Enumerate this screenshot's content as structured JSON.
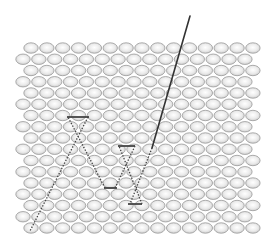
{
  "diagram": {
    "title": "Atomic lattice with probe path",
    "lattice": {
      "rows": 17,
      "cols_per_row": 15,
      "row_start_y": 48,
      "row_spacing": 11.25,
      "col_pitch": 15.85,
      "odd_row_start_x": 31,
      "even_row_start_x": 23,
      "atom_rx": 7.2,
      "atom_ry": 5.2,
      "atom_fill": "#e8e8e8",
      "atom_stroke": "#9a9a9a"
    },
    "probe_line": {
      "points": [
        [
          190,
          16
        ],
        [
          152,
          148
        ]
      ],
      "color": "#333333",
      "width": 1.6
    },
    "dotted_path": {
      "color": "#444444",
      "segments": [
        {
          "type": "dotted",
          "from": [
            152,
            148
          ],
          "to": [
            130,
            204
          ]
        },
        {
          "type": "solid",
          "from": [
            128,
            204
          ],
          "to": [
            142,
            204
          ]
        },
        {
          "type": "dotted",
          "from": [
            142,
            204
          ],
          "to": [
            119,
            146
          ]
        },
        {
          "type": "solid",
          "from": [
            118,
            146
          ],
          "to": [
            135,
            146
          ]
        },
        {
          "type": "dotted",
          "from": [
            135,
            146
          ],
          "to": [
            115,
            188
          ]
        },
        {
          "type": "solid",
          "from": [
            104,
            188
          ],
          "to": [
            117,
            188
          ]
        },
        {
          "type": "dotted",
          "from": [
            105,
            188
          ],
          "to": [
            68,
            117
          ]
        },
        {
          "type": "solid",
          "from": [
            67,
            117
          ],
          "to": [
            89,
            117
          ]
        },
        {
          "type": "dotted",
          "from": [
            88,
            117
          ],
          "to": [
            30,
            231
          ]
        }
      ]
    }
  }
}
